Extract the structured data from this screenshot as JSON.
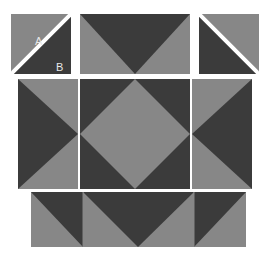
{
  "diagram": {
    "background_color": "#ffffff",
    "palette": {
      "dark": "#3b3b3b",
      "light": "#878787",
      "seam": "#ffffff",
      "label_text": "#e8e8e8"
    },
    "labels": {
      "a": "A",
      "b": "B"
    },
    "units": [
      {
        "name": "top-left-unit",
        "description": "Half-square triangle unit with light triangle A upper-left and dark triangle B lower-right, split by white seam line",
        "x": 11,
        "y": 14,
        "w": 60,
        "h": 60,
        "pattern": "diagonal-split-tlbr-seam",
        "labels": [
          "A",
          "B"
        ]
      },
      {
        "name": "top-center-unit",
        "description": "Rectangle with dark downward-pointing triangle on light ground",
        "x": 80,
        "y": 14,
        "w": 110,
        "h": 60,
        "pattern": "flying-geese-down"
      },
      {
        "name": "top-right-unit",
        "description": "Half-square triangle unit with dark triangle lower-left and light triangle upper-right, split by white seam line",
        "x": 199,
        "y": 14,
        "w": 60,
        "h": 60,
        "pattern": "diagonal-split-trbl-seam"
      },
      {
        "name": "middle-left-unit",
        "description": "Tall rectangle with dark right-pointing triangle on light ground",
        "x": 18,
        "y": 79,
        "w": 60,
        "h": 110,
        "pattern": "flying-geese-right"
      },
      {
        "name": "center-unit",
        "description": "Square with light square-on-point diamond centered on dark ground",
        "x": 80,
        "y": 79,
        "w": 110,
        "h": 110,
        "pattern": "square-on-point"
      },
      {
        "name": "middle-right-unit",
        "description": "Tall rectangle with dark left-pointing triangle on light ground",
        "x": 192,
        "y": 79,
        "w": 60,
        "h": 110,
        "pattern": "flying-geese-left"
      },
      {
        "name": "bottom-row-unit",
        "description": "Wide strip of three sections: dark upper-right triangle, dark downward triangle, dark upper-left triangle, all on light ground",
        "x": 31,
        "y": 192,
        "w": 215,
        "h": 55,
        "pattern": "bottom-strip"
      }
    ]
  }
}
